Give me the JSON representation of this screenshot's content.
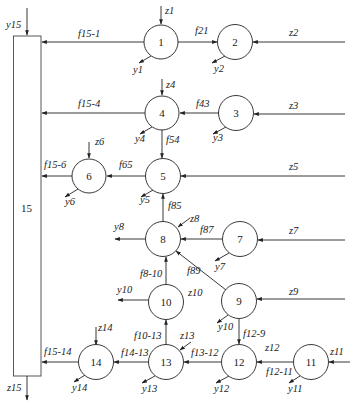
{
  "diagram": {
    "type": "flow-network",
    "box": {
      "id": "15",
      "label": "15",
      "input": "y15",
      "output": "z15"
    },
    "nodes": [
      {
        "id": "1",
        "label": "1",
        "x": 161,
        "y": 42,
        "in": "z1",
        "out": "y1"
      },
      {
        "id": "2",
        "label": "2",
        "x": 235,
        "y": 42,
        "in": "z2",
        "out": "y2"
      },
      {
        "id": "3",
        "label": "3",
        "x": 236,
        "y": 113,
        "in": "z3",
        "out": "y3"
      },
      {
        "id": "4",
        "label": "4",
        "x": 162,
        "y": 113,
        "in": "z4",
        "out": "y4"
      },
      {
        "id": "5",
        "label": "5",
        "x": 163,
        "y": 176,
        "in": "z5",
        "out": "y5"
      },
      {
        "id": "6",
        "label": "6",
        "x": 89,
        "y": 176,
        "in": "z6",
        "out": "y6"
      },
      {
        "id": "7",
        "label": "7",
        "x": 240,
        "y": 239,
        "in": "z7",
        "out": "y7"
      },
      {
        "id": "8",
        "label": "8",
        "x": 163,
        "y": 239,
        "in": "z8",
        "out": "y8"
      },
      {
        "id": "9",
        "label": "9",
        "x": 239,
        "y": 301,
        "in": "z9",
        "out": "y10"
      },
      {
        "id": "10",
        "label": "10",
        "x": 166,
        "y": 302,
        "in": "z10",
        "out": "y10"
      },
      {
        "id": "11",
        "label": "11",
        "x": 311,
        "y": 362,
        "in": "z11",
        "out": "y11"
      },
      {
        "id": "12",
        "label": "12",
        "x": 239,
        "y": 362,
        "in": "z12",
        "out": "y12"
      },
      {
        "id": "13",
        "label": "13",
        "x": 166,
        "y": 362,
        "in": "z13",
        "out": "y13"
      },
      {
        "id": "14",
        "label": "14",
        "x": 95,
        "y": 362,
        "in": "z14",
        "out": "y14"
      }
    ],
    "edges": [
      {
        "from": "1",
        "to": "15",
        "label": "f15-1"
      },
      {
        "from": "1",
        "to": "2",
        "label": "f21"
      },
      {
        "from": "4",
        "to": "15",
        "label": "f15-4"
      },
      {
        "from": "3",
        "to": "4",
        "label": "f43"
      },
      {
        "from": "4",
        "to": "5",
        "label": "f54"
      },
      {
        "from": "5",
        "to": "6",
        "label": "f65"
      },
      {
        "from": "6",
        "to": "15",
        "label": "f15-6"
      },
      {
        "from": "8",
        "to": "5",
        "label": "f85"
      },
      {
        "from": "7",
        "to": "8",
        "label": "f87"
      },
      {
        "from": "9",
        "to": "8",
        "label": "f89"
      },
      {
        "from": "10",
        "to": "8",
        "label": "f8-10"
      },
      {
        "from": "13",
        "to": "10",
        "label": "f10-13"
      },
      {
        "from": "9",
        "to": "12",
        "label": "f12-9"
      },
      {
        "from": "12",
        "to": "13",
        "label": "f13-12"
      },
      {
        "from": "11",
        "to": "12",
        "label": "f12-11"
      },
      {
        "from": "13",
        "to": "14",
        "label": "f14-13"
      },
      {
        "from": "14",
        "to": "15",
        "label": "f15-14"
      }
    ],
    "labels": {
      "y15": "y15",
      "z15": "z15",
      "box15": "15",
      "z1": "z1",
      "y1": "y1",
      "f15_1": "f15-1",
      "f21": "f21",
      "z2": "z2",
      "y2": "y2",
      "z4": "z4",
      "y4": "y4",
      "f15_4": "f15-4",
      "f43": "f43",
      "z3": "z3",
      "y3": "y3",
      "f54": "f54",
      "z6": "z6",
      "y6": "y6",
      "f15_6": "f15-6",
      "f65": "f65",
      "z5": "z5",
      "y5": "y5",
      "f85": "f85",
      "y8": "y8",
      "z8": "z8",
      "f87": "f87",
      "z7": "z7",
      "y7": "y7",
      "f8_10": "f8-10",
      "f89": "f89",
      "y10a": "y10",
      "z10": "z10",
      "z9": "z9",
      "y10b": "y10",
      "f12_9": "f12-9",
      "z14": "z14",
      "y14": "y14",
      "f15_14": "f15-14",
      "f10_13": "f10-13",
      "z13": "z13",
      "f14_13": "f14-13",
      "y13": "y13",
      "f13_12": "f13-12",
      "z12": "z12",
      "y12": "y12",
      "f12_11": "f12-11",
      "z11": "z11",
      "y11": "y11",
      "n1": "1",
      "n2": "2",
      "n3": "3",
      "n4": "4",
      "n5": "5",
      "n6": "6",
      "n7": "7",
      "n8": "8",
      "n9": "9",
      "n10": "10",
      "n11": "11",
      "n12": "12",
      "n13": "13",
      "n14": "14"
    }
  }
}
